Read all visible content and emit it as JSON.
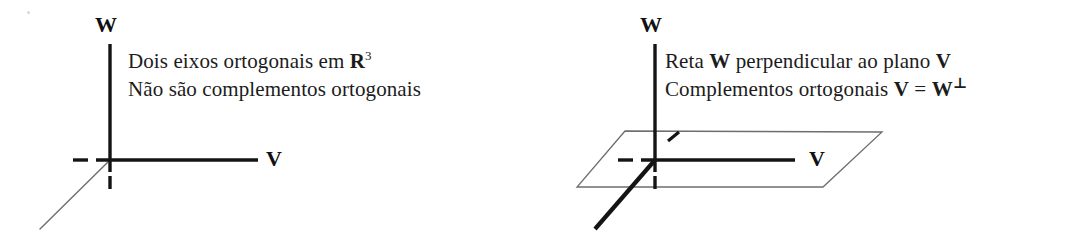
{
  "figure": {
    "background_color": "#ffffff",
    "ink_color": "#1a1a1a",
    "thin_line_color": "#6e6e6e"
  },
  "panels": [
    {
      "id": "left",
      "caption_line1_pre": "Dois eixos ortogonais em ",
      "caption_line1_bold": "R",
      "caption_line1_sup": "3",
      "caption_line2": "Não são complementos ortogonais",
      "axis_w_label": "W",
      "axis_v_label": "V",
      "diagram_type": "two-orthogonal-axes",
      "elements": [
        "vertical-w-axis",
        "horizontal-v-axis",
        "thin-diagonal-third-axis",
        "left-tick-dash",
        "below-tick-dash"
      ]
    },
    {
      "id": "right",
      "caption_line1_pre": "Reta ",
      "caption_line1_bold1": "W",
      "caption_line1_mid": " perpendicular ao plano ",
      "caption_line1_bold2": "V",
      "caption_line2_pre": "Complementos ortogonais ",
      "caption_line2_bold1": "V",
      "caption_line2_eq": " = ",
      "caption_line2_bold2": "W",
      "caption_line2_perp": "⊥",
      "axis_w_label": "W",
      "axis_v_label": "V",
      "diagram_type": "line-perpendicular-to-plane",
      "elements": [
        "vertical-w-axis",
        "horizontal-v-axis",
        "bold-diagonal-w-line",
        "plane-parallelogram",
        "hidden-line-tick",
        "left-tick-dash",
        "below-tick-dash"
      ]
    }
  ]
}
